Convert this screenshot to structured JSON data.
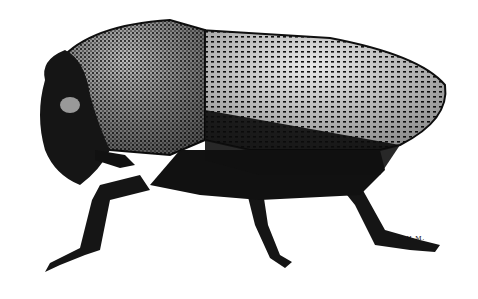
{
  "image": {
    "subject": "beetle illustration, lateral view",
    "style": "black and white stipple engraving",
    "signature": "C H M."
  },
  "colors": {
    "ink": "#0d0d0d",
    "paper": "#ffffff",
    "mid": "#555555",
    "light": "#cfcfcf"
  }
}
